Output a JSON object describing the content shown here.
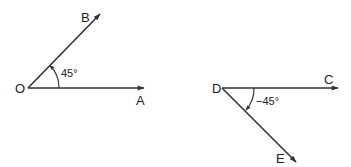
{
  "diagrams": [
    {
      "name": "positive-angle",
      "vertex": {
        "label": "O",
        "x": 28,
        "y": 88
      },
      "rays": [
        {
          "label": "A",
          "x2": 144,
          "y2": 88,
          "label_x": 136,
          "label_y": 104
        },
        {
          "label": "B",
          "x2": 100,
          "y2": 13,
          "label_x": 81,
          "label_y": 21
        }
      ],
      "angle_label": "45°",
      "angle_label_x": 60,
      "angle_label_y": 77
    },
    {
      "name": "negative-angle",
      "vertex": {
        "label": "D",
        "x": 222,
        "y": 88
      },
      "rays": [
        {
          "label": "C",
          "x2": 338,
          "y2": 88,
          "label_x": 324,
          "label_y": 84
        },
        {
          "label": "E",
          "x2": 296,
          "y2": 162,
          "label_x": 277,
          "label_y": 163
        }
      ],
      "angle_label": "−45°",
      "angle_label_x": 256,
      "angle_label_y": 105
    }
  ],
  "colors": {
    "line": "#333333",
    "background": "#ffffff"
  }
}
